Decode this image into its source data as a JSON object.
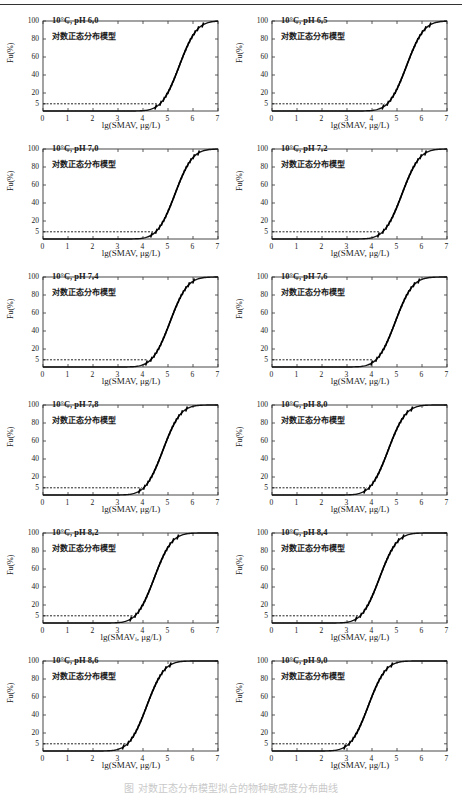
{
  "figure": {
    "caption": "图  对数正态分布模型拟合的物种敏感度分布曲线",
    "y_ticks": [
      "100",
      "80",
      "60",
      "40",
      "20",
      "5"
    ],
    "x_ticks": [
      "0",
      "1",
      "2",
      "3",
      "4",
      "5",
      "6",
      "7"
    ],
    "ylabel": "Fu(%)",
    "xlabel": "lg(SMAV,  μg/L)",
    "model_label": "对数正态分布模型"
  },
  "chart_data": [
    {
      "type": "line",
      "title": "10°C, pH 6.0",
      "subtitle": "对数正态分布模型",
      "xlabel": "lg(SMAV,  μg/L)",
      "ylabel": "Fu(%)",
      "xlim": [
        0,
        7
      ],
      "ylim": [
        0,
        100
      ],
      "yticks": [
        5,
        20,
        40,
        60,
        80,
        100
      ],
      "hc5_lg": 4.55,
      "mu": 5.45,
      "sigma": 0.55,
      "series": [
        {
          "name": "fitted",
          "style": "solid"
        },
        {
          "name": "HC5",
          "style": "dashed",
          "y": 5
        }
      ]
    },
    {
      "type": "line",
      "title": "10°C, pH 6.5",
      "subtitle": "对数正态分布模型",
      "xlabel": "lg(SMAV,  μg/L)",
      "ylabel": "Fu(%)",
      "xlim": [
        0,
        7
      ],
      "ylim": [
        0,
        100
      ],
      "yticks": [
        5,
        20,
        40,
        60,
        80,
        100
      ],
      "hc5_lg": 4.5,
      "mu": 5.38,
      "sigma": 0.55,
      "series": [
        {
          "name": "fitted",
          "style": "solid"
        },
        {
          "name": "HC5",
          "style": "dashed",
          "y": 5
        }
      ]
    },
    {
      "type": "line",
      "title": "10°C, pH 7.0",
      "subtitle": "对数正态分布模型",
      "xlabel": "lg(SMAV,  μg/L)",
      "ylabel": "Fu(%)",
      "xlim": [
        0,
        7
      ],
      "ylim": [
        0,
        100
      ],
      "yticks": [
        5,
        20,
        40,
        60,
        80,
        100
      ],
      "hc5_lg": 4.4,
      "mu": 5.28,
      "sigma": 0.55,
      "series": [
        {
          "name": "fitted",
          "style": "solid"
        },
        {
          "name": "HC5",
          "style": "dashed",
          "y": 5
        }
      ]
    },
    {
      "type": "line",
      "title": "10°C, pH 7.2",
      "subtitle": "对数正态分布模型",
      "xlabel": "lg(SMAV,  μg/L)",
      "ylabel": "Fu(%)",
      "xlim": [
        0,
        7
      ],
      "ylim": [
        0,
        100
      ],
      "yticks": [
        5,
        20,
        40,
        60,
        80,
        100
      ],
      "hc5_lg": 4.3,
      "mu": 5.2,
      "sigma": 0.55,
      "series": [
        {
          "name": "fitted",
          "style": "solid"
        },
        {
          "name": "HC5",
          "style": "dashed",
          "y": 5
        }
      ]
    },
    {
      "type": "line",
      "title": "10°C, pH 7.4",
      "subtitle": "对数正态分布模型",
      "xlabel": "lg(SMAV,  μg/L)",
      "ylabel": "Fu(%)",
      "xlim": [
        0,
        7
      ],
      "ylim": [
        0,
        100
      ],
      "yticks": [
        5,
        20,
        40,
        60,
        80,
        100
      ],
      "hc5_lg": 4.2,
      "mu": 5.08,
      "sigma": 0.55,
      "series": [
        {
          "name": "fitted",
          "style": "solid"
        },
        {
          "name": "HC5",
          "style": "dashed",
          "y": 5
        }
      ]
    },
    {
      "type": "line",
      "title": "10°C, pH 7.6",
      "subtitle": "对数正态分布模型",
      "xlabel": "lg(SMAV,  μg/L)",
      "ylabel": "Fu(%)",
      "xlim": [
        0,
        7
      ],
      "ylim": [
        0,
        100
      ],
      "yticks": [
        5,
        20,
        40,
        60,
        80,
        100
      ],
      "hc5_lg": 4.05,
      "mu": 4.93,
      "sigma": 0.55,
      "series": [
        {
          "name": "fitted",
          "style": "solid"
        },
        {
          "name": "HC5",
          "style": "dashed",
          "y": 5
        }
      ]
    },
    {
      "type": "line",
      "title": "10°C, pH 7.8",
      "subtitle": "对数正态分布模型",
      "xlabel": "lg(SMAV,  μg/L)",
      "ylabel": "Fu(%)",
      "xlim": [
        0,
        7
      ],
      "ylim": [
        0,
        100
      ],
      "yticks": [
        5,
        20,
        40,
        60,
        80,
        100
      ],
      "hc5_lg": 3.95,
      "mu": 4.8,
      "sigma": 0.55,
      "series": [
        {
          "name": "fitted",
          "style": "solid"
        },
        {
          "name": "HC5",
          "style": "dashed",
          "y": 5
        }
      ]
    },
    {
      "type": "line",
      "title": "10°C, pH 8.0",
      "subtitle": "对数正态分布模型",
      "xlabel": "lg(SMAV,  μg/L)",
      "ylabel": "Fu(%)",
      "xlim": [
        0,
        7
      ],
      "ylim": [
        0,
        100
      ],
      "yticks": [
        5,
        20,
        40,
        60,
        80,
        100
      ],
      "hc5_lg": 3.8,
      "mu": 4.65,
      "sigma": 0.55,
      "series": [
        {
          "name": "fitted",
          "style": "solid"
        },
        {
          "name": "HC5",
          "style": "dashed",
          "y": 5
        }
      ]
    },
    {
      "type": "line",
      "title": "10°C, pH 8.2",
      "subtitle": "对数正态分布模型",
      "xlabel": "lg(SMAVᵢ,  μg/L)",
      "ylabel": "Fu(%)",
      "xlim": [
        0,
        7
      ],
      "ylim": [
        0,
        100
      ],
      "yticks": [
        5,
        20,
        40,
        60,
        80,
        100
      ],
      "hc5_lg": 3.6,
      "mu": 4.45,
      "sigma": 0.55,
      "series": [
        {
          "name": "fitted",
          "style": "solid"
        },
        {
          "name": "HC5",
          "style": "dashed",
          "y": 5
        }
      ]
    },
    {
      "type": "line",
      "title": "10°C, pH 8.4",
      "subtitle": "对数正态分布模型",
      "xlabel": "lg(SMAV,  μg/L)",
      "ylabel": "Fu(%)",
      "xlim": [
        0,
        7
      ],
      "ylim": [
        0,
        100
      ],
      "yticks": [
        5,
        20,
        40,
        60,
        80,
        100
      ],
      "hc5_lg": 3.45,
      "mu": 4.3,
      "sigma": 0.55,
      "series": [
        {
          "name": "fitted",
          "style": "solid"
        },
        {
          "name": "HC5",
          "style": "dashed",
          "y": 5
        }
      ]
    },
    {
      "type": "line",
      "title": "10°C, pH 8.6",
      "subtitle": "对数正态分布模型",
      "xlabel": "lg(SMAV,  μg/L)",
      "ylabel": "Fu(%)",
      "xlim": [
        0,
        7
      ],
      "ylim": [
        0,
        100
      ],
      "yticks": [
        5,
        20,
        40,
        60,
        80,
        100
      ],
      "hc5_lg": 3.3,
      "mu": 4.15,
      "sigma": 0.55,
      "series": [
        {
          "name": "fitted",
          "style": "solid"
        },
        {
          "name": "HC5",
          "style": "dashed",
          "y": 5
        }
      ]
    },
    {
      "type": "line",
      "title": "10°C, pH 9.0",
      "subtitle": "对数正态分布模型",
      "xlabel": "lg(SMAV,  μg/L)",
      "ylabel": "Fu(%)",
      "xlim": [
        0,
        7
      ],
      "ylim": [
        0,
        100
      ],
      "yticks": [
        5,
        20,
        40,
        60,
        80,
        100
      ],
      "hc5_lg": 3.0,
      "mu": 3.85,
      "sigma": 0.55,
      "series": [
        {
          "name": "fitted",
          "style": "solid"
        },
        {
          "name": "HC5",
          "style": "dashed",
          "y": 5
        }
      ]
    }
  ]
}
